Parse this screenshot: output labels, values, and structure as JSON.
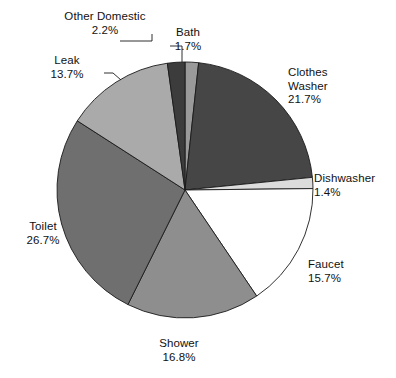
{
  "chart_data": {
    "type": "pie",
    "title": "",
    "subtitle": "",
    "xlabel": "",
    "ylabel": "",
    "legend_position": "none",
    "grid": false,
    "units": "percent",
    "start_angle_deg": 0,
    "direction": "clockwise",
    "categories": [
      "Bath",
      "Clothes Washer",
      "Dishwasher",
      "Faucet",
      "Shower",
      "Toilet",
      "Leak",
      "Other Domestic"
    ],
    "values": [
      1.7,
      21.7,
      1.4,
      15.7,
      16.8,
      26.7,
      13.7,
      2.2
    ],
    "slices": [
      {
        "name": "Bath",
        "value": 1.7,
        "value_label": "1.7%",
        "label_lines": [
          "Bath",
          "1.7%"
        ],
        "color": "#9a9a9a",
        "leader": true
      },
      {
        "name": "Clothes Washer",
        "value": 21.7,
        "value_label": "21.7%",
        "label_lines": [
          "Clothes",
          "Washer",
          "21.7%"
        ],
        "color": "#464646",
        "leader": false
      },
      {
        "name": "Dishwasher",
        "value": 1.4,
        "value_label": "1.4%",
        "label_lines": [
          "Dishwasher",
          "1.4%"
        ],
        "color": "#dcdcdc",
        "leader": false
      },
      {
        "name": "Faucet",
        "value": 15.7,
        "value_label": "15.7%",
        "label_lines": [
          "Faucet",
          "15.7%"
        ],
        "color": "#ffffff",
        "leader": false
      },
      {
        "name": "Shower",
        "value": 16.8,
        "value_label": "16.8%",
        "label_lines": [
          "Shower",
          "16.8%"
        ],
        "color": "#8e8e8e",
        "leader": false
      },
      {
        "name": "Toilet",
        "value": 26.7,
        "value_label": "26.7%",
        "label_lines": [
          "Toilet",
          "26.7%"
        ],
        "color": "#6f6f6f",
        "leader": false
      },
      {
        "name": "Leak",
        "value": 13.7,
        "value_label": "13.7%",
        "label_lines": [
          "Leak",
          "13.7%"
        ],
        "color": "#aaaaaa",
        "leader": true
      },
      {
        "name": "Other Domestic",
        "value": 2.2,
        "value_label": "2.2%",
        "label_lines": [
          "Other Domestic",
          "2.2%"
        ],
        "color": "#3c3c3c",
        "leader": true
      }
    ]
  },
  "labels": {
    "other_domestic": {
      "name": "Other Domestic",
      "pct": "2.2%"
    },
    "bath": {
      "name": "Bath",
      "pct": "1.7%"
    },
    "leak": {
      "name": "Leak",
      "pct": "13.7%"
    },
    "clothes_washer": {
      "name_line1": "Clothes",
      "name_line2": "Washer",
      "pct": "21.7%"
    },
    "dishwasher": {
      "name": "Dishwasher",
      "pct": "1.4%"
    },
    "faucet": {
      "name": "Faucet",
      "pct": "15.7%"
    },
    "shower": {
      "name": "Shower",
      "pct": "16.8%"
    },
    "toilet": {
      "name": "Toilet",
      "pct": "26.7%"
    }
  },
  "style": {
    "background": "#ffffff",
    "outline": "#1a1a1a",
    "text": "#111111"
  }
}
